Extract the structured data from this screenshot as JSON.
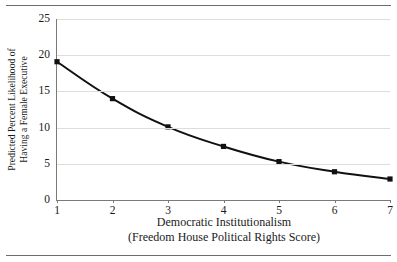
{
  "figure": {
    "has_top_rule": true,
    "has_bottom_rule": true,
    "background": "#ffffff",
    "line_color": "#111111",
    "grid_color": "#dddddd",
    "axis_color": "#7a7a7a"
  },
  "chart_data": {
    "type": "line",
    "title": "",
    "subtitle": "",
    "xlabel": "Democratic Institutionalism",
    "xlabel_line2": "(Freedom House Political Rights Score)",
    "ylabel_line1": "Predicted Percent Likelihood of",
    "ylabel_line2": "Having a Female Executive",
    "x": [
      1,
      2,
      3,
      4,
      5,
      6,
      7
    ],
    "values": [
      19.1,
      14.0,
      10.1,
      7.4,
      5.3,
      3.9,
      2.9
    ],
    "series": [
      {
        "name": "Predicted percent likelihood",
        "values": [
          19.1,
          14.0,
          10.1,
          7.4,
          5.3,
          3.9,
          2.9
        ]
      }
    ],
    "xticks": [
      "1",
      "2",
      "3",
      "4",
      "5",
      "6",
      "7"
    ],
    "yticks": [
      "0",
      "5",
      "10",
      "15",
      "20",
      "25"
    ],
    "ytick_values": [
      0,
      5,
      10,
      15,
      20,
      25
    ],
    "xlim": [
      1,
      7
    ],
    "ylim": [
      0,
      25
    ],
    "grid": "horizontal",
    "legend": "none",
    "marker": "square",
    "marker_color": "#111111",
    "line_width": 2
  }
}
